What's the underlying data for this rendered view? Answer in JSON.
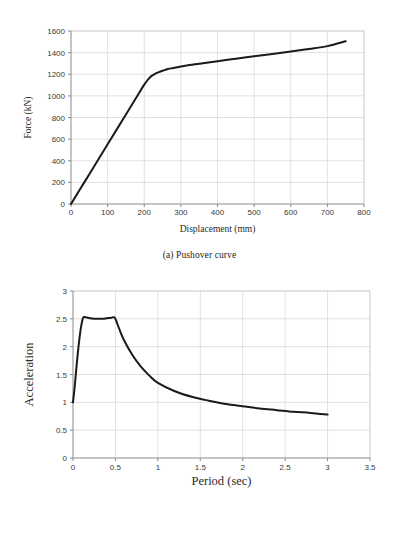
{
  "figures": [
    {
      "id": "pushover",
      "caption": "(a) Pushover curve"
    },
    {
      "id": "response-spectrum",
      "caption": "(b) Response spectrum"
    }
  ],
  "chart_data": [
    {
      "type": "line",
      "id": "pushover-curve",
      "title": "",
      "xlabel": "Displacement (mm)",
      "ylabel": "Force (kN)",
      "xlim": [
        0,
        800
      ],
      "ylim": [
        0,
        1600
      ],
      "xticks": [
        0,
        100,
        200,
        300,
        400,
        500,
        600,
        700,
        800
      ],
      "xtick_labels": [
        "0",
        "100",
        "200",
        "300",
        "400",
        "500",
        "600",
        "700",
        "800"
      ],
      "yticks": [
        0,
        200,
        400,
        600,
        800,
        1000,
        1200,
        1400,
        1600
      ],
      "ytick_labels": [
        "0",
        "200",
        "400",
        "600",
        "800",
        "1000",
        "1200",
        "1400",
        "1600"
      ],
      "grid": true,
      "legend": "none",
      "line_color": "#1a1a1a",
      "line_width": 2.0,
      "x": [
        0,
        25,
        50,
        75,
        100,
        125,
        150,
        175,
        200,
        210,
        220,
        230,
        240,
        250,
        265,
        280,
        300,
        330,
        360,
        400,
        450,
        500,
        550,
        600,
        650,
        700,
        750
      ],
      "y": [
        0,
        138,
        276,
        414,
        552,
        690,
        828,
        966,
        1104,
        1150,
        1185,
        1205,
        1220,
        1232,
        1248,
        1258,
        1272,
        1288,
        1302,
        1320,
        1344,
        1366,
        1388,
        1410,
        1434,
        1460,
        1505
      ]
    },
    {
      "type": "line",
      "id": "response-spectrum-curve",
      "title": "",
      "xlabel": "Period (sec)",
      "ylabel": "Acceleration",
      "xlim": [
        0,
        3.5
      ],
      "ylim": [
        0,
        3
      ],
      "xticks": [
        0,
        0.5,
        1,
        1.5,
        2,
        2.5,
        3,
        3.5
      ],
      "xtick_labels": [
        "0",
        "0.5",
        "1",
        "1.5",
        "2",
        "2.5",
        "3",
        "3.5"
      ],
      "yticks": [
        0,
        0.5,
        1,
        1.5,
        2,
        2.5,
        3
      ],
      "ytick_labels": [
        "0",
        "0.5",
        "1",
        "1.5",
        "2",
        "2.5",
        "3"
      ],
      "grid": true,
      "legend": "none",
      "line_color": "#1a1a1a",
      "line_width": 2.0,
      "x": [
        0,
        0.02,
        0.05,
        0.08,
        0.1,
        0.12,
        0.15,
        0.2,
        0.25,
        0.3,
        0.35,
        0.4,
        0.45,
        0.48,
        0.5,
        0.55,
        0.6,
        0.7,
        0.8,
        0.9,
        1.0,
        1.2,
        1.4,
        1.6,
        1.8,
        2.0,
        2.2,
        2.4,
        2.6,
        2.8,
        3.0
      ],
      "y": [
        1.0,
        1.28,
        1.78,
        2.2,
        2.4,
        2.52,
        2.53,
        2.51,
        2.5,
        2.5,
        2.5,
        2.51,
        2.52,
        2.53,
        2.5,
        2.3,
        2.12,
        1.85,
        1.64,
        1.48,
        1.35,
        1.2,
        1.1,
        1.03,
        0.97,
        0.93,
        0.89,
        0.86,
        0.83,
        0.81,
        0.78
      ]
    }
  ]
}
